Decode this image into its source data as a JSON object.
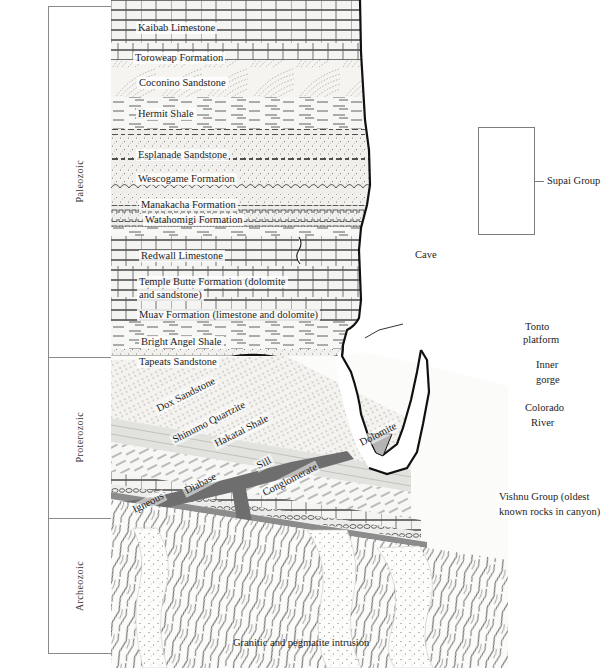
{
  "figure": {
    "caption": "Granitic and pegmatite intrusion"
  },
  "eras": [
    {
      "name": "Paleozoic",
      "top": 6,
      "bottom": 357
    },
    {
      "name": "Proterozoic",
      "top": 357,
      "bottom": 518
    },
    {
      "name": "Archeozoic",
      "top": 518,
      "bottom": 654
    }
  ],
  "periods": [
    {
      "name": "Permian",
      "top": 6,
      "bottom": 162,
      "divider": "solid"
    },
    {
      "name": "Pennsylvanian",
      "top": 162,
      "bottom": 232,
      "divider": "solid"
    },
    {
      "name": "Mississippian",
      "top": 232,
      "bottom": 265,
      "divider": "dashed"
    },
    {
      "name": "Devonian",
      "top": 265,
      "bottom": 292,
      "divider": "bracket"
    },
    {
      "name": "Cambrian",
      "top": 292,
      "bottom": 357,
      "divider": "solid"
    }
  ],
  "formations": [
    {
      "label": "Kaibab Limestone",
      "x": 25,
      "y": 22
    },
    {
      "label": "Toroweap Formation",
      "x": 22,
      "y": 52
    },
    {
      "label": "Coconino Sandstone",
      "x": 26,
      "y": 77
    },
    {
      "label": "Hermit Shale",
      "x": 25,
      "y": 108
    },
    {
      "label": "Esplanade Sandstone",
      "x": 25,
      "y": 149
    },
    {
      "label": "Wescogame Formation",
      "x": 25,
      "y": 173
    },
    {
      "label": "Manakacha Formation",
      "x": 28,
      "y": 199
    },
    {
      "label": "Watahomigi Formation",
      "x": 32,
      "y": 214
    },
    {
      "label": "Redwall Limestone",
      "x": 28,
      "y": 250
    },
    {
      "label": "Temple Butte Formation (dolomite",
      "x": 26,
      "y": 276
    },
    {
      "label": "and sandstone)",
      "x": 26,
      "y": 289
    },
    {
      "label": "Muav Formation (limestone and dolomite)",
      "x": 26,
      "y": 309
    },
    {
      "label": "Bright Angel Shale",
      "x": 28,
      "y": 336
    },
    {
      "label": "Tapeats Sandstone",
      "x": 26,
      "y": 356
    }
  ],
  "precambrian_units": [
    {
      "label": "Dox Sandstone",
      "x": 42,
      "y": 405,
      "rotate": -27
    },
    {
      "label": "Shinumo Quartzite",
      "x": 58,
      "y": 436,
      "rotate": -27
    },
    {
      "label": "Hakatai Shale",
      "x": 100,
      "y": 440,
      "rotate": -27
    },
    {
      "label": "Sill",
      "x": 142,
      "y": 462,
      "rotate": -27
    },
    {
      "label": "Diabase",
      "x": 70,
      "y": 487,
      "rotate": -27
    },
    {
      "label": "Igneous",
      "x": 18,
      "y": 506,
      "rotate": -27
    },
    {
      "label": "Conglomerate",
      "x": 148,
      "y": 489,
      "rotate": -27
    },
    {
      "label": "Dolomite",
      "x": 245,
      "y": 439,
      "rotate": -27
    }
  ],
  "features": [
    {
      "name": "cave",
      "label": "Cave",
      "x": 302,
      "y": 249
    },
    {
      "name": "tonto",
      "label": "Tonto",
      "x": 412,
      "y": 321
    },
    {
      "name": "tonto2",
      "label": "platform",
      "x": 410,
      "y": 334
    },
    {
      "name": "inner-gorge",
      "label": "Inner",
      "x": 423,
      "y": 359
    },
    {
      "name": "inner-gorge2",
      "label": "gorge",
      "x": 423,
      "y": 374
    },
    {
      "name": "colorado",
      "label": "Colorado",
      "x": 412,
      "y": 402
    },
    {
      "name": "colorado2",
      "label": "River",
      "x": 418,
      "y": 417
    },
    {
      "name": "vishnu",
      "label": "Vishnu Group (oldest",
      "x": 386,
      "y": 491
    },
    {
      "name": "vishnu2",
      "label": "known rocks in canyon)",
      "x": 386,
      "y": 506
    }
  ],
  "groups": [
    {
      "label": "Supai Group",
      "box": {
        "x": 367,
        "y": 127,
        "w": 57,
        "h": 108
      },
      "tick": {
        "x": 424,
        "y": 181,
        "w": 9
      },
      "text": {
        "x": 436,
        "y": 175
      }
    }
  ],
  "colors": {
    "ink": "#1c1c1c",
    "frame": "#8a8a8a",
    "limestone_fill": "#f4f4f2",
    "sandstone_fill": "#f0efec",
    "shale_fill": "#f7f7f5",
    "quartzite_fill": "#e3e3e0",
    "diabase_fill": "#6e6e6e",
    "river_fill": "#b4b4b4",
    "basement_fill": "#fbfbfa"
  }
}
